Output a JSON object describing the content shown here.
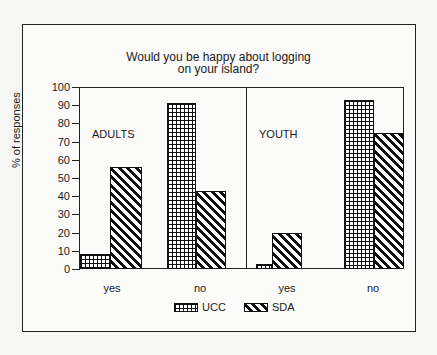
{
  "chart_data": {
    "type": "bar",
    "title": "Would you be happy about logging on your island?",
    "title_lines": [
      "Would you be happy about logging",
      "on your island?"
    ],
    "ylabel": "% of responses",
    "xlabel": "",
    "ylim": [
      0,
      100
    ],
    "yticks": [
      0,
      10,
      20,
      30,
      40,
      50,
      60,
      70,
      80,
      90,
      100
    ],
    "legend": [
      "UCC",
      "SDA"
    ],
    "legend_position": "bottom",
    "grid": false,
    "panels": [
      {
        "name": "ADULTS",
        "categories": [
          "yes",
          "no"
        ],
        "series": [
          {
            "name": "UCC",
            "values": [
              8,
              91
            ]
          },
          {
            "name": "SDA",
            "values": [
              56,
              43
            ]
          }
        ]
      },
      {
        "name": "YOUTH",
        "categories": [
          "yes",
          "no"
        ],
        "series": [
          {
            "name": "UCC",
            "values": [
              3,
              93
            ]
          },
          {
            "name": "SDA",
            "values": [
              20,
              75
            ]
          }
        ]
      }
    ]
  },
  "labels": {
    "title_line1": "Would you be happy about logging",
    "title_line2": "on your island?",
    "ylabel": "% of responses",
    "adults": "ADULTS",
    "youth": "YOUTH",
    "x_adults_yes": "yes",
    "x_adults_no": "no",
    "x_youth_yes": "yes",
    "x_youth_no": "no",
    "legend_ucc": "UCC",
    "legend_sda": "SDA",
    "ticks": [
      "0",
      "10",
      "20",
      "30",
      "40",
      "50",
      "60",
      "70",
      "80",
      "90",
      "100"
    ]
  }
}
